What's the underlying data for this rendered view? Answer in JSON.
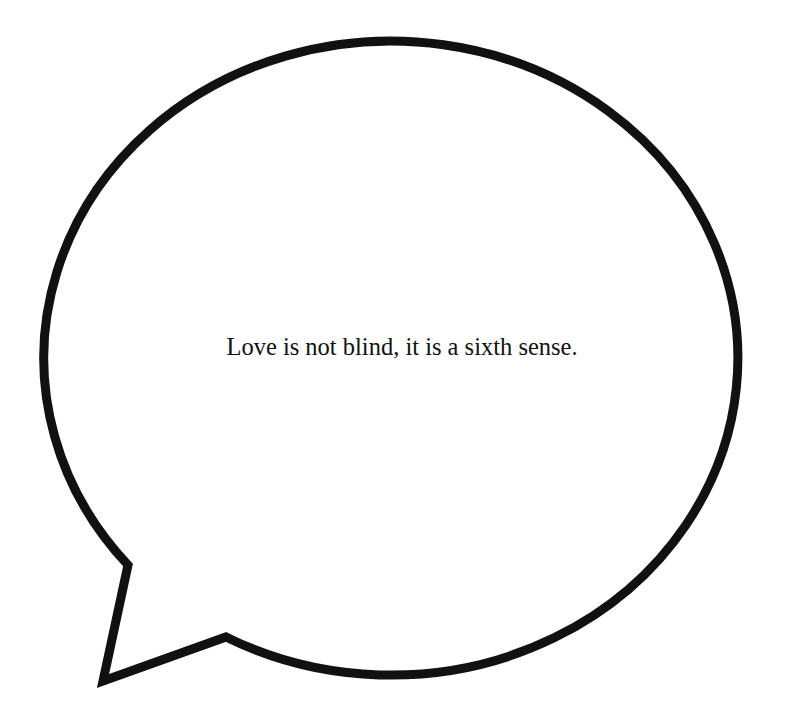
{
  "bubble": {
    "text": "Love is not blind, it is a sixth sense.",
    "stroke_color": "#111111",
    "fill_color": "#ffffff",
    "stroke_width": 9
  }
}
